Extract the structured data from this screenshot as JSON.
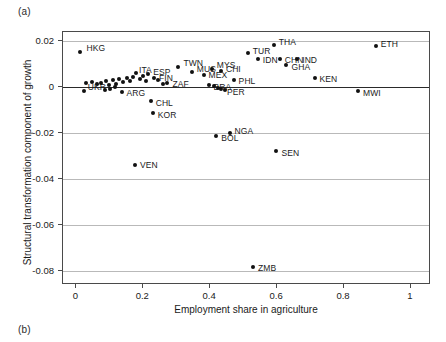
{
  "panels": {
    "a_label": "(a)",
    "b_label": "(b)"
  },
  "chart_data": {
    "type": "scatter",
    "title": "",
    "xlabel": "Employment share in agriculture",
    "ylabel": "Structural transformation component of growth",
    "xlim": [
      -0.04,
      1.06
    ],
    "ylim": [
      -0.086,
      0.024
    ],
    "xticks": [
      0,
      0.2,
      0.4,
      0.6,
      0.8,
      1
    ],
    "xticklabels": [
      "0",
      "0.2",
      "0.4",
      "0.6",
      "0.8",
      "1"
    ],
    "yticks": [
      0.02,
      0,
      -0.02,
      -0.04,
      -0.06,
      -0.08
    ],
    "yticklabels": [
      "0.02",
      "0",
      "-0.02",
      "-0.04",
      "-0.06",
      "-0.08"
    ],
    "grid": "horizontal",
    "zero_reference_line": 0,
    "legend": "none",
    "marker_color": "#111111",
    "points": [
      {
        "label": "HKG",
        "x": 0.012,
        "y": 0.0155,
        "lx": 6,
        "ly": -4
      },
      {
        "label": "UKR",
        "x": 0.022,
        "y": -0.0018,
        "lx": 4,
        "ly": -4
      },
      {
        "label": "TWN",
        "x": 0.305,
        "y": 0.0088,
        "lx": 5,
        "ly": -4
      },
      {
        "label": "MUS",
        "x": 0.345,
        "y": 0.0068,
        "lx": 5,
        "ly": -3
      },
      {
        "label": "MYS",
        "x": 0.405,
        "y": 0.008,
        "lx": 5,
        "ly": -4
      },
      {
        "label": "CHI",
        "x": 0.432,
        "y": 0.0072,
        "lx": 5,
        "ly": -2
      },
      {
        "label": "MEX",
        "x": 0.38,
        "y": 0.0054,
        "lx": 5,
        "ly": 0
      },
      {
        "label": "ESP",
        "x": 0.215,
        "y": 0.0058,
        "lx": 5,
        "ly": -2
      },
      {
        "label": "ITA",
        "x": 0.178,
        "y": 0.006,
        "lx": 3,
        "ly": -3
      },
      {
        "label": "FIN",
        "x": 0.232,
        "y": 0.0042,
        "lx": 5,
        "ly": 0
      },
      {
        "label": "ZAF",
        "x": 0.272,
        "y": 0.0018,
        "lx": 5,
        "ly": 1
      },
      {
        "label": "BRA",
        "x": 0.395,
        "y": 0.001,
        "lx": 5,
        "ly": 2
      },
      {
        "label": "PER",
        "x": 0.432,
        "y": -0.0008,
        "lx": 6,
        "ly": 3
      },
      {
        "label": "ARG",
        "x": 0.135,
        "y": -0.0022,
        "lx": 5,
        "ly": 1
      },
      {
        "label": "CHL",
        "x": 0.222,
        "y": -0.0062,
        "lx": 5,
        "ly": 2
      },
      {
        "label": "KOR",
        "x": 0.228,
        "y": -0.0112,
        "lx": 5,
        "ly": 2
      },
      {
        "label": "VEN",
        "x": 0.175,
        "y": -0.0338,
        "lx": 5,
        "ly": 0
      },
      {
        "label": "PHL",
        "x": 0.47,
        "y": 0.0032,
        "lx": 5,
        "ly": 1
      },
      {
        "label": "TUR",
        "x": 0.512,
        "y": 0.0148,
        "lx": 5,
        "ly": -2
      },
      {
        "label": "IDN",
        "x": 0.542,
        "y": 0.0122,
        "lx": 5,
        "ly": 1
      },
      {
        "label": "THA",
        "x": 0.59,
        "y": 0.0182,
        "lx": 5,
        "ly": -3
      },
      {
        "label": "CHN",
        "x": 0.608,
        "y": 0.0122,
        "lx": 5,
        "ly": 1
      },
      {
        "label": "IND",
        "x": 0.66,
        "y": 0.0122,
        "lx": 5,
        "ly": 1
      },
      {
        "label": "GHA",
        "x": 0.628,
        "y": 0.0098,
        "lx": 5,
        "ly": 2
      },
      {
        "label": "KEN",
        "x": 0.712,
        "y": 0.0042,
        "lx": 5,
        "ly": 1
      },
      {
        "label": "ETH",
        "x": 0.895,
        "y": 0.0178,
        "lx": 5,
        "ly": -2
      },
      {
        "label": "MWI",
        "x": 0.842,
        "y": -0.0018,
        "lx": 5,
        "ly": 2
      },
      {
        "label": "BOL",
        "x": 0.418,
        "y": -0.0212,
        "lx": 5,
        "ly": 2
      },
      {
        "label": "NGA",
        "x": 0.458,
        "y": -0.0198,
        "lx": 5,
        "ly": -2
      },
      {
        "label": "SEN",
        "x": 0.598,
        "y": -0.0278,
        "lx": 5,
        "ly": 2
      },
      {
        "label": "ZMB",
        "x": 0.528,
        "y": -0.0782,
        "lx": 5,
        "ly": 1
      },
      {
        "label": "",
        "x": 0.03,
        "y": 0.002,
        "lx": 0,
        "ly": 0
      },
      {
        "label": "",
        "x": 0.048,
        "y": 0.0022,
        "lx": 0,
        "ly": 0
      },
      {
        "label": "",
        "x": 0.062,
        "y": 0.0012,
        "lx": 0,
        "ly": 0
      },
      {
        "label": "",
        "x": 0.075,
        "y": 0.0018,
        "lx": 0,
        "ly": 0
      },
      {
        "label": "",
        "x": 0.088,
        "y": 0.0026,
        "lx": 0,
        "ly": 0
      },
      {
        "label": "",
        "x": 0.098,
        "y": 0.0008,
        "lx": 0,
        "ly": 0
      },
      {
        "label": "",
        "x": 0.108,
        "y": 0.003,
        "lx": 0,
        "ly": 0
      },
      {
        "label": "",
        "x": 0.118,
        "y": 0.0014,
        "lx": 0,
        "ly": 0
      },
      {
        "label": "",
        "x": 0.128,
        "y": 0.0034,
        "lx": 0,
        "ly": 0
      },
      {
        "label": "",
        "x": 0.14,
        "y": 0.0022,
        "lx": 0,
        "ly": 0
      },
      {
        "label": "",
        "x": 0.15,
        "y": 0.004,
        "lx": 0,
        "ly": 0
      },
      {
        "label": "",
        "x": 0.16,
        "y": 0.0028,
        "lx": 0,
        "ly": 0
      },
      {
        "label": "",
        "x": 0.17,
        "y": 0.0044,
        "lx": 0,
        "ly": 0
      },
      {
        "label": "",
        "x": 0.19,
        "y": 0.0036,
        "lx": 0,
        "ly": 0
      },
      {
        "label": "",
        "x": 0.2,
        "y": 0.005,
        "lx": 0,
        "ly": 0
      },
      {
        "label": "",
        "x": 0.208,
        "y": 0.0026,
        "lx": 0,
        "ly": 0
      },
      {
        "label": "",
        "x": 0.245,
        "y": 0.003,
        "lx": 0,
        "ly": 0
      },
      {
        "label": "",
        "x": 0.258,
        "y": 0.0014,
        "lx": 0,
        "ly": 0
      },
      {
        "label": "",
        "x": 0.085,
        "y": -0.001,
        "lx": 0,
        "ly": 0
      },
      {
        "label": "",
        "x": 0.1,
        "y": -0.0006,
        "lx": 0,
        "ly": 0
      },
      {
        "label": "",
        "x": 0.115,
        "y": 0.0002,
        "lx": 0,
        "ly": 0
      },
      {
        "label": "",
        "x": 0.412,
        "y": 0.0004,
        "lx": 0,
        "ly": 0
      },
      {
        "label": "",
        "x": 0.424,
        "y": -0.0002,
        "lx": 0,
        "ly": 0
      },
      {
        "label": "",
        "x": 0.445,
        "y": -0.001,
        "lx": 0,
        "ly": 0
      }
    ]
  }
}
